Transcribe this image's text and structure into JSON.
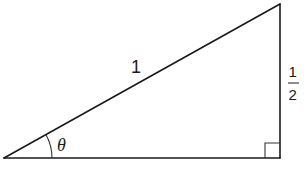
{
  "diagram": {
    "type": "right-triangle",
    "vertices": {
      "left": {
        "x": 4,
        "y": 158
      },
      "right_angle": {
        "x": 280,
        "y": 158
      },
      "top": {
        "x": 280,
        "y": 4
      }
    },
    "labels": {
      "hypotenuse": "1",
      "opposite_numerator": "1",
      "opposite_denominator": "2",
      "angle": "θ"
    },
    "markers": {
      "right_angle_box_size": 15,
      "angle_arc_radius": 48
    },
    "colors": {
      "stroke": "#1a1a1a",
      "background": "#ffffff"
    }
  }
}
